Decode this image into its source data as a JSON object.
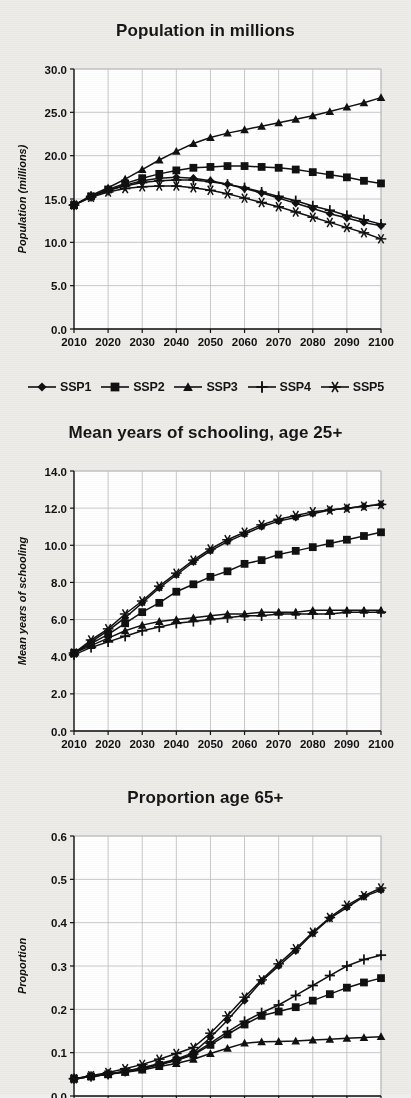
{
  "figure": {
    "background_color": "#edece9",
    "plot_background_color": "#ffffff",
    "ink_color": "#111111",
    "grid_color": "#bdbdbd"
  },
  "legend": {
    "position": "below-first-panel",
    "entries": [
      {
        "label": "SSP1",
        "marker": "diamond"
      },
      {
        "label": "SSP2",
        "marker": "square"
      },
      {
        "label": "SSP3",
        "marker": "triangle"
      },
      {
        "label": "SSP4",
        "marker": "plus"
      },
      {
        "label": "SSP5",
        "marker": "asterisk"
      }
    ]
  },
  "panels": [
    {
      "title": "Population in millions"
    },
    {
      "title": "Mean years of schooling, age 25+"
    },
    {
      "title": "Proportion age 65+"
    }
  ],
  "chart_data": [
    {
      "type": "line",
      "title": "Population in millions",
      "xlabel": "",
      "ylabel": "Population (millions)",
      "x": [
        2010,
        2015,
        2020,
        2025,
        2030,
        2035,
        2040,
        2045,
        2050,
        2055,
        2060,
        2065,
        2070,
        2075,
        2080,
        2085,
        2090,
        2095,
        2100
      ],
      "xlim": [
        2010,
        2100
      ],
      "xticks": [
        2010,
        2020,
        2030,
        2040,
        2050,
        2060,
        2070,
        2080,
        2090,
        2100
      ],
      "xticklabels": [
        "2010",
        "2020",
        "2030",
        "2040",
        "2050",
        "2060",
        "2070",
        "2080",
        "2090",
        "2100"
      ],
      "ylim": [
        0.0,
        30.0
      ],
      "yticks": [
        0.0,
        5.0,
        10.0,
        15.0,
        20.0,
        25.0,
        30.0
      ],
      "yticklabels": [
        "0.0",
        "5.0",
        "10.0",
        "15.0",
        "20.0",
        "25.0",
        "30.0"
      ],
      "grid": true,
      "legend": [
        "SSP1",
        "SSP2",
        "SSP3",
        "SSP4",
        "SSP5"
      ],
      "series": [
        {
          "name": "SSP1",
          "marker": "diamond",
          "values": [
            14.3,
            15.3,
            16.0,
            16.6,
            17.1,
            17.4,
            17.5,
            17.4,
            17.1,
            16.7,
            16.2,
            15.7,
            15.1,
            14.5,
            13.9,
            13.3,
            12.8,
            12.3,
            11.9
          ]
        },
        {
          "name": "SSP2",
          "marker": "square",
          "values": [
            14.3,
            15.3,
            16.1,
            16.8,
            17.4,
            17.9,
            18.3,
            18.6,
            18.7,
            18.8,
            18.8,
            18.7,
            18.6,
            18.4,
            18.1,
            17.8,
            17.5,
            17.1,
            16.8
          ]
        },
        {
          "name": "SSP3",
          "marker": "triangle",
          "values": [
            14.3,
            15.4,
            16.3,
            17.3,
            18.4,
            19.5,
            20.5,
            21.4,
            22.1,
            22.6,
            23.0,
            23.4,
            23.8,
            24.2,
            24.6,
            25.1,
            25.6,
            26.1,
            26.7
          ]
        },
        {
          "name": "SSP4",
          "marker": "plus",
          "values": [
            14.3,
            15.3,
            16.0,
            16.5,
            16.9,
            17.1,
            17.2,
            17.2,
            17.0,
            16.7,
            16.3,
            15.8,
            15.3,
            14.8,
            14.2,
            13.7,
            13.1,
            12.6,
            12.1
          ]
        },
        {
          "name": "SSP5",
          "marker": "asterisk",
          "values": [
            14.3,
            15.2,
            15.8,
            16.2,
            16.4,
            16.5,
            16.5,
            16.3,
            16.0,
            15.6,
            15.1,
            14.6,
            14.1,
            13.5,
            12.9,
            12.3,
            11.7,
            11.1,
            10.4
          ]
        }
      ]
    },
    {
      "type": "line",
      "title": "Mean years of schooling, age 25+",
      "xlabel": "",
      "ylabel": "Mean years of schooling",
      "x": [
        2010,
        2015,
        2020,
        2025,
        2030,
        2035,
        2040,
        2045,
        2050,
        2055,
        2060,
        2065,
        2070,
        2075,
        2080,
        2085,
        2090,
        2095,
        2100
      ],
      "xlim": [
        2010,
        2100
      ],
      "xticks": [
        2010,
        2020,
        2030,
        2040,
        2050,
        2060,
        2070,
        2080,
        2090,
        2100
      ],
      "xticklabels": [
        "2010",
        "2020",
        "2030",
        "2040",
        "2050",
        "2060",
        "2070",
        "2080",
        "2090",
        "2100"
      ],
      "ylim": [
        0.0,
        14.0
      ],
      "yticks": [
        0.0,
        2.0,
        4.0,
        6.0,
        8.0,
        10.0,
        12.0,
        14.0
      ],
      "yticklabels": [
        "0.0",
        "2.0",
        "4.0",
        "6.0",
        "8.0",
        "10.0",
        "12.0",
        "14.0"
      ],
      "grid": true,
      "legend": [
        "SSP1",
        "SSP2",
        "SSP3",
        "SSP4",
        "SSP5"
      ],
      "series": [
        {
          "name": "SSP1",
          "marker": "diamond",
          "values": [
            4.2,
            4.8,
            5.4,
            6.1,
            6.9,
            7.7,
            8.4,
            9.1,
            9.7,
            10.2,
            10.6,
            11.0,
            11.3,
            11.5,
            11.7,
            11.9,
            12.0,
            12.1,
            12.2
          ]
        },
        {
          "name": "SSP2",
          "marker": "square",
          "values": [
            4.2,
            4.7,
            5.2,
            5.8,
            6.4,
            6.9,
            7.5,
            7.9,
            8.3,
            8.6,
            9.0,
            9.2,
            9.5,
            9.7,
            9.9,
            10.1,
            10.3,
            10.5,
            10.7
          ]
        },
        {
          "name": "SSP3",
          "marker": "triangle",
          "values": [
            4.2,
            4.6,
            5.0,
            5.4,
            5.7,
            5.9,
            6.0,
            6.1,
            6.2,
            6.3,
            6.3,
            6.4,
            6.4,
            6.4,
            6.5,
            6.5,
            6.5,
            6.5,
            6.5
          ]
        },
        {
          "name": "SSP4",
          "marker": "plus",
          "values": [
            4.1,
            4.5,
            4.8,
            5.1,
            5.4,
            5.6,
            5.8,
            5.9,
            6.0,
            6.1,
            6.2,
            6.2,
            6.3,
            6.3,
            6.3,
            6.3,
            6.4,
            6.4,
            6.4
          ]
        },
        {
          "name": "SSP5",
          "marker": "asterisk",
          "values": [
            4.2,
            4.9,
            5.5,
            6.3,
            7.0,
            7.8,
            8.5,
            9.2,
            9.8,
            10.3,
            10.7,
            11.1,
            11.4,
            11.6,
            11.8,
            11.9,
            12.0,
            12.1,
            12.2
          ]
        }
      ]
    },
    {
      "type": "line",
      "title": "Proportion age 65+",
      "xlabel": "",
      "ylabel": "Proportion",
      "x": [
        2010,
        2015,
        2020,
        2025,
        2030,
        2035,
        2040,
        2045,
        2050,
        2055,
        2060,
        2065,
        2070,
        2075,
        2080,
        2085,
        2090,
        2095,
        2100
      ],
      "xlim": [
        2010,
        2100
      ],
      "xticks": [
        2010,
        2020,
        2030,
        2040,
        2050,
        2060,
        2070,
        2080,
        2090,
        2100
      ],
      "xticklabels": [
        "2010",
        "2020",
        "2030",
        "2040",
        "2050",
        "2060",
        "2070",
        "2080",
        "2090",
        "2100"
      ],
      "ylim": [
        0.0,
        0.6
      ],
      "yticks": [
        0.0,
        0.1,
        0.2,
        0.3,
        0.4,
        0.5,
        0.6
      ],
      "yticklabels": [
        "0.0",
        "0.1",
        "0.2",
        "0.3",
        "0.4",
        "0.5",
        "0.6"
      ],
      "grid": true,
      "legend": [
        "SSP1",
        "SSP2",
        "SSP3",
        "SSP4",
        "SSP5"
      ],
      "clipped_bottom": true,
      "series": [
        {
          "name": "SSP1",
          "marker": "diamond",
          "values": [
            0.04,
            0.045,
            0.05,
            0.057,
            0.065,
            0.075,
            0.085,
            0.1,
            0.135,
            0.175,
            0.22,
            0.265,
            0.3,
            0.335,
            0.375,
            0.41,
            0.435,
            0.46,
            0.475
          ]
        },
        {
          "name": "SSP2",
          "marker": "square",
          "values": [
            0.04,
            0.045,
            0.05,
            0.056,
            0.063,
            0.072,
            0.082,
            0.095,
            0.118,
            0.142,
            0.165,
            0.185,
            0.195,
            0.205,
            0.22,
            0.235,
            0.25,
            0.262,
            0.272
          ]
        },
        {
          "name": "SSP3",
          "marker": "triangle",
          "values": [
            0.04,
            0.045,
            0.05,
            0.055,
            0.06,
            0.068,
            0.075,
            0.085,
            0.098,
            0.11,
            0.122,
            0.125,
            0.126,
            0.127,
            0.129,
            0.131,
            0.133,
            0.135,
            0.137
          ]
        },
        {
          "name": "SSP4",
          "marker": "plus",
          "values": [
            0.04,
            0.045,
            0.05,
            0.057,
            0.064,
            0.073,
            0.083,
            0.097,
            0.122,
            0.148,
            0.172,
            0.192,
            0.21,
            0.232,
            0.255,
            0.278,
            0.3,
            0.315,
            0.325
          ]
        },
        {
          "name": "SSP5",
          "marker": "asterisk",
          "values": [
            0.04,
            0.047,
            0.054,
            0.063,
            0.073,
            0.085,
            0.098,
            0.112,
            0.145,
            0.185,
            0.228,
            0.268,
            0.305,
            0.34,
            0.378,
            0.412,
            0.44,
            0.462,
            0.48
          ]
        }
      ]
    }
  ]
}
